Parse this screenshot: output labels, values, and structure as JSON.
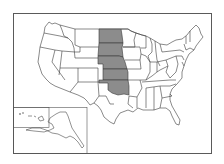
{
  "map": {
    "title": "United States",
    "highlight_color": "#8c8c8c",
    "default_fill": "#ffffff",
    "border_color": "#3a3a3a",
    "highlighted_states": [
      "North Dakota",
      "South Dakota",
      "Nebraska",
      "Kansas",
      "Oklahoma"
    ],
    "insets": [
      "Alaska",
      "Hawaii"
    ]
  }
}
